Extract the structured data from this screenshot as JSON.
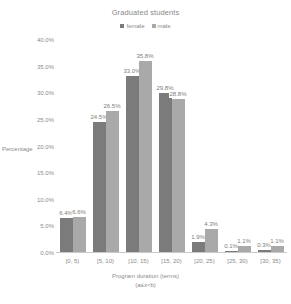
{
  "chart_data": {
    "type": "bar",
    "title": "Graduated students",
    "xlabel": "Program duration (terms)",
    "xlabel_sub": "(a≤x<b)",
    "ylabel": "Percentage",
    "ylim": [
      0,
      40
    ],
    "ytick_step": 5,
    "grid": false,
    "legend_position": "top-center",
    "categories": [
      "[0, 5)",
      "[5, 10)",
      "[10, 15)",
      "[15, 20)",
      "[20, 25)",
      "[25, 30)",
      "[30, 35)"
    ],
    "yticks": [
      "0.0%",
      "5.0%",
      "10.0%",
      "15.0%",
      "20.0%",
      "25.0%",
      "30.0%",
      "35.0%",
      "40.0%"
    ],
    "ytick_values": [
      0,
      5,
      10,
      15,
      20,
      25,
      30,
      35,
      40
    ],
    "series": [
      {
        "name": "female",
        "color": "#7b7b7b",
        "values": [
          6.4,
          24.5,
          33.0,
          29.8,
          1.9,
          0.1,
          0.3
        ],
        "labels": [
          "6.4%",
          "24.5%",
          "33.0%",
          "29.8%",
          "1.9%",
          "0.1%",
          "0.3%"
        ]
      },
      {
        "name": "male",
        "color": "#a9a9a9",
        "values": [
          6.6,
          26.5,
          35.8,
          28.8,
          4.3,
          1.1,
          1.1
        ],
        "labels": [
          "6.6%",
          "26.5%",
          "35.8%",
          "28.8%",
          "4.3%",
          "1.1%",
          "1.1%"
        ]
      }
    ]
  },
  "legend": {
    "items": [
      {
        "label": "female",
        "swatch": "female"
      },
      {
        "label": "male",
        "swatch": "male"
      }
    ]
  }
}
